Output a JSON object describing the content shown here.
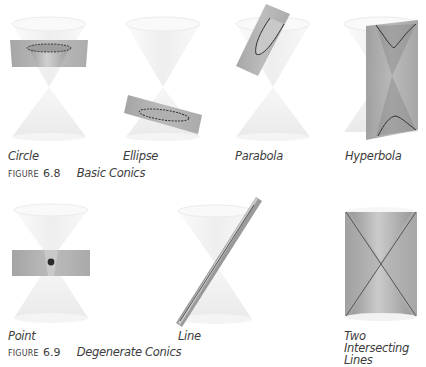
{
  "figure_6_8": {
    "caption_prefix": "FIGURE",
    "caption_number": "6.8",
    "caption_title": "Basic Conics",
    "panels": [
      {
        "label": "Circle",
        "icon": "cone-circle-section-icon"
      },
      {
        "label": "Ellipse",
        "icon": "cone-ellipse-section-icon"
      },
      {
        "label": "Parabola",
        "icon": "cone-parabola-section-icon"
      },
      {
        "label": "Hyperbola",
        "icon": "cone-hyperbola-section-icon"
      }
    ]
  },
  "figure_6_9": {
    "caption_prefix": "FIGURE",
    "caption_number": "6.9",
    "caption_title": "Degenerate Conics",
    "panels": [
      {
        "label": "Point",
        "icon": "cone-point-section-icon"
      },
      {
        "label": "Line",
        "icon": "cone-line-section-icon"
      },
      {
        "label": "Two Intersecting Lines",
        "label_line1": "Two Intersecting",
        "label_line2": "Lines",
        "icon": "cone-two-lines-section-icon"
      }
    ]
  },
  "colors": {
    "cone_fill": "#f2f2f2",
    "cone_rim": "#e8e8e8",
    "plane_fill": "#a9a9a9",
    "plane_dark": "#8a8a8a",
    "curve_stroke": "#3a3a3a",
    "text": "#3c3c3c"
  }
}
